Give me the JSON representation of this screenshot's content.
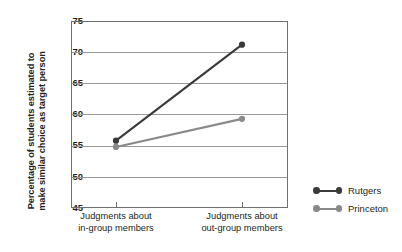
{
  "chart_data": {
    "type": "line",
    "title": "",
    "xlabel": "",
    "ylabel_line1": "Percentage of students estimated to",
    "ylabel_line2": "make similar choice as target person",
    "categories": [
      "Judgments about in-group members",
      "Judgments about out-group members"
    ],
    "category_labels": [
      {
        "line1": "Judgments about",
        "line2": "in-group members"
      },
      {
        "line1": "Judgments about",
        "line2": "out-group members"
      }
    ],
    "series": [
      {
        "name": "Rutgers",
        "values": [
          55.8,
          71.2
        ],
        "color": "#3a3a3a"
      },
      {
        "name": "Princeton",
        "values": [
          54.8,
          59.3
        ],
        "color": "#8a8a8a"
      }
    ],
    "ylim": [
      45,
      75
    ],
    "yticks": [
      75,
      70,
      65,
      60,
      55,
      50,
      45
    ],
    "ytick_labels": [
      "75",
      "70",
      "65",
      "60",
      "55",
      "50",
      "45"
    ],
    "grid": true,
    "grid_color": "#9a9a9a",
    "axis_color": "#6f6f6f",
    "background": "#ffffff",
    "legend_position": "right"
  },
  "legend": {
    "entries": [
      {
        "label": "Rutgers",
        "color": "#3a3a3a"
      },
      {
        "label": "Princeton",
        "color": "#8a8a8a"
      }
    ]
  }
}
